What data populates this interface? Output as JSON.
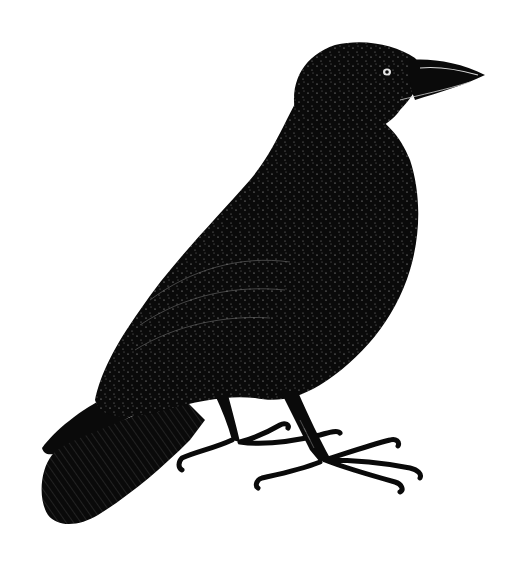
{
  "image": {
    "subject": "crow",
    "style": "black-and-white engraving illustration",
    "alt": "Engraved illustration of a crow standing in profile, facing right",
    "colors": {
      "background": "#ffffff",
      "ink": "#0a0a0a",
      "highlight": "#d8d8d8"
    }
  }
}
